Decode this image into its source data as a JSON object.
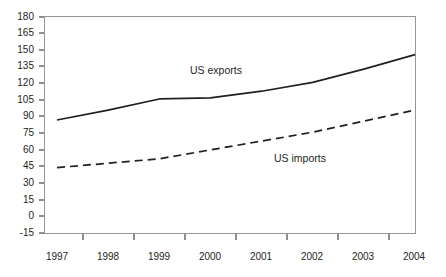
{
  "chart_data": {
    "type": "line",
    "title": "",
    "subtitle": "",
    "xlabel": "",
    "ylabel": "",
    "x": [
      "1997",
      "1998",
      "1999",
      "2000",
      "2001",
      "2002",
      "2003",
      "2004"
    ],
    "categories": [
      "1997",
      "1998",
      "1999",
      "2000",
      "2001",
      "2002",
      "2003",
      "2004"
    ],
    "series": [
      {
        "name": "US exports",
        "style": "solid",
        "color": "#231f20",
        "values": [
          87,
          96,
          106,
          107,
          113,
          121,
          133,
          146
        ]
      },
      {
        "name": "US imports",
        "style": "dashed",
        "color": "#231f20",
        "values": [
          44,
          48,
          52,
          60,
          68,
          76,
          86,
          96
        ]
      }
    ],
    "ylim": [
      -15,
      180
    ],
    "ytick_values": [
      180,
      165,
      150,
      135,
      120,
      105,
      90,
      75,
      60,
      45,
      30,
      15,
      0,
      -15
    ],
    "ytick_labels": [
      "180",
      "165",
      "150",
      "135",
      "120",
      "105",
      "90",
      "75",
      "60",
      "45",
      "30",
      "15",
      "0",
      "-15"
    ],
    "xtick_labels": [
      "1997",
      "1998",
      "1999",
      "2000",
      "2001",
      "2002",
      "2003",
      "2004"
    ],
    "grid": false,
    "legend_position": "inline-annotations",
    "annotations": [
      {
        "text": "US exports",
        "x_px": 190,
        "y_px": 64
      },
      {
        "text": "US imports",
        "x_px": 274,
        "y_px": 152
      }
    ],
    "axis_color": "#939598",
    "plot_box": true
  }
}
